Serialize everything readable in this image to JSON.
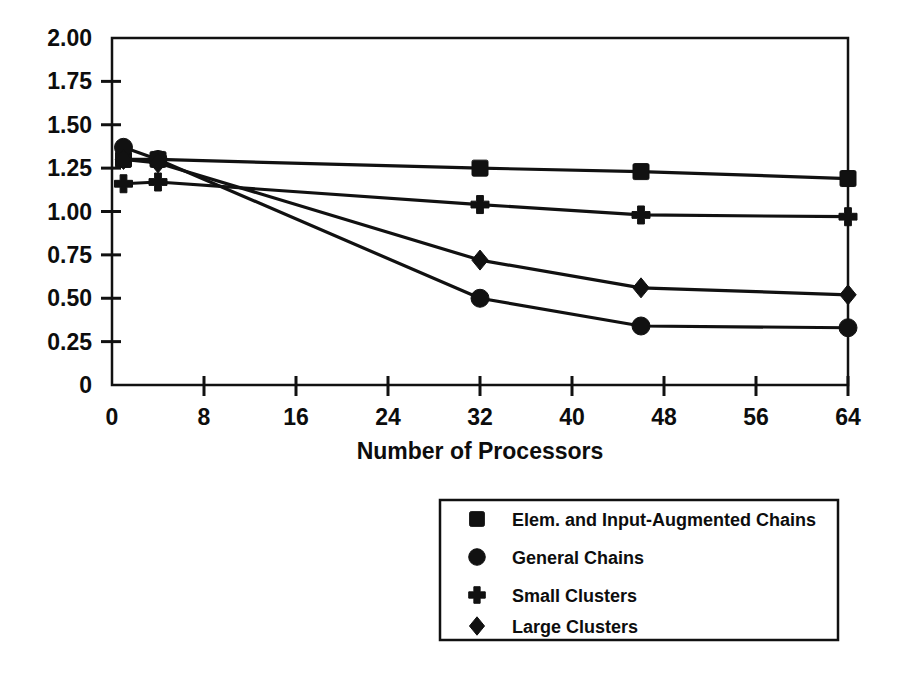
{
  "chart_data": {
    "type": "line",
    "title": "",
    "subtitle": "",
    "xlabel": "Number of Processors",
    "ylabel": "",
    "xlim": [
      0,
      64
    ],
    "ylim": [
      0,
      2.0
    ],
    "grid": false,
    "legend_position": "below-right",
    "x_ticks": [
      0,
      8,
      16,
      24,
      32,
      40,
      48,
      56,
      64
    ],
    "x_tick_labels": [
      "0",
      "8",
      "16",
      "24",
      "32",
      "40",
      "48",
      "56",
      "64"
    ],
    "y_ticks": [
      0,
      0.25,
      0.5,
      0.75,
      1.0,
      1.25,
      1.5,
      1.75,
      2.0
    ],
    "y_tick_labels": [
      "0",
      "0.25",
      "0.50",
      "0.75",
      "1.00",
      "1.25",
      "1.50",
      "1.75",
      "2.00"
    ],
    "series": [
      {
        "name": "Elem. and Input-Augmented Chains",
        "marker": "square",
        "x": [
          1,
          4,
          32,
          46,
          64
        ],
        "values": [
          1.3,
          1.3,
          1.25,
          1.23,
          1.19
        ]
      },
      {
        "name": "General Chains",
        "marker": "circle",
        "x": [
          1,
          4,
          32,
          46,
          64
        ],
        "values": [
          1.37,
          1.3,
          0.5,
          0.34,
          0.33
        ]
      },
      {
        "name": "Small Clusters",
        "marker": "plus",
        "x": [
          1,
          4,
          32,
          46,
          64
        ],
        "values": [
          1.16,
          1.17,
          1.04,
          0.98,
          0.97
        ]
      },
      {
        "name": "Large Clusters",
        "marker": "diamond",
        "x": [
          1,
          4,
          32,
          46,
          64
        ],
        "values": [
          1.3,
          1.28,
          0.72,
          0.56,
          0.52
        ]
      }
    ]
  },
  "legend": {
    "entries": [
      {
        "label": "Elem. and Input-Augmented Chains",
        "marker": "square"
      },
      {
        "label": "General Chains",
        "marker": "circle"
      },
      {
        "label": "Small Clusters",
        "marker": "plus"
      },
      {
        "label": "Large Clusters",
        "marker": "diamond"
      }
    ]
  },
  "colors": {
    "ink": "#111111",
    "background": "#ffffff"
  }
}
